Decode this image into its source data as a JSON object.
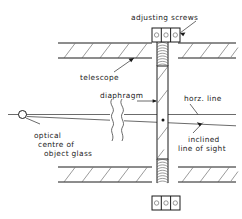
{
  "diagram": {
    "background_color": "#ffffff",
    "ink_color": "#1a1a1a",
    "width": 242,
    "height": 219,
    "labels": {
      "adjusting_screws": "adjusting  screws",
      "telescope": "telescope",
      "diaphragm": "diaphragm",
      "horz_line": "horz. line",
      "inclined_line_1": "inclined",
      "inclined_line_2": "line  of  sight",
      "optical_centre_1": "optical",
      "optical_centre_2": "centre  of",
      "optical_centre_3": "object  glass"
    },
    "parts": {
      "nut_cells": 3,
      "screw_thread_turns_top": 9,
      "screw_thread_turns_bottom": 9,
      "hatch_count_upper_left": 5,
      "hatch_count_upper_right": 4,
      "hatch_count_lower_left": 5,
      "hatch_count_lower_right": 3,
      "break_marks": 2,
      "crosshair_dot": true
    }
  }
}
